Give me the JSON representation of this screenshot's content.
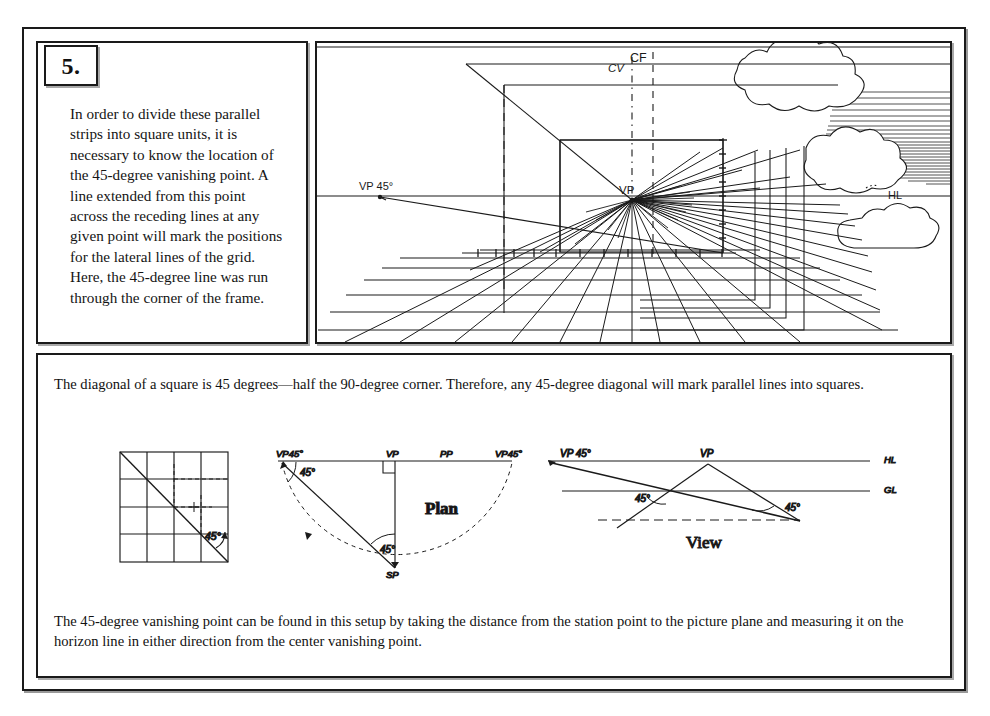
{
  "page": {
    "step_number": "5.",
    "intro_text": "In order to divide these parallel strips into square units, it is necessary to know the location of the 45-degree vanishing point. A line extended from this point across the receding lines at any given point will mark the positions for the lateral lines of the grid. Here, the 45-degree line was run through the corner of the frame.",
    "caption_top": "The diagonal of a square is 45 degrees—half the 90-degree corner. Therefore, any 45-degree diagonal will mark parallel lines into squares.",
    "caption_bottom": "The 45-degree vanishing point can be found in this setup by taking the distance from the station point to the picture plane and measuring it on the horizon line in either direction from the center vanishing point.",
    "ink_color": "#1a1a1a",
    "paper_color": "#ffffff"
  },
  "perspective_drawing": {
    "labels": {
      "cv": "CV",
      "cf": "CF",
      "vp": "VP",
      "vp45": "VP 45°",
      "hl": "HL"
    },
    "vanishing_point": {
      "x": 632,
      "y": 200
    },
    "vp45_point": {
      "x": 380,
      "y": 196
    },
    "horizon_line_y": 196,
    "ray_count": 26,
    "floor_grid_columns": 12,
    "floor_grid_rows": 7,
    "wall_tick_count": 8
  },
  "square_diagram": {
    "name": "square-grid-diagram",
    "angle_label": "45°",
    "grid_divisions": 4,
    "box": {
      "x": 120,
      "y": 452,
      "w": 108,
      "h": 110
    }
  },
  "plan_diagram": {
    "name": "plan-diagram",
    "title": "Plan",
    "labels": {
      "vp45_left": "VP45°",
      "vp": "VP",
      "pp": "PP",
      "vp45_right": "VP45°",
      "sp": "SP",
      "angle_top": "45°",
      "angle_bottom": "45°"
    }
  },
  "view_diagram": {
    "name": "view-diagram",
    "title": "View",
    "labels": {
      "vp45": "VP 45°",
      "vp": "VP",
      "hl": "HL",
      "gl": "GL",
      "angle_left": "45°",
      "angle_right": "45°"
    }
  }
}
